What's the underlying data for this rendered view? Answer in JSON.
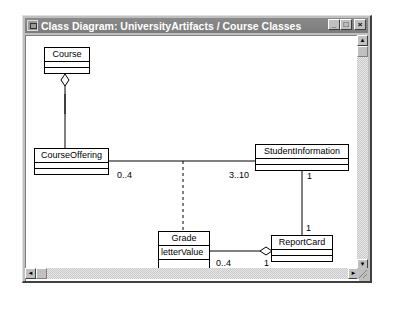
{
  "window": {
    "title": "Class Diagram: UniversityArtifacts / Course Classes",
    "buttons": {
      "minimize": "_",
      "maximize": "□",
      "close": "×"
    }
  },
  "scrollbars": {
    "vertical": {
      "up": "▲",
      "down": "▼"
    },
    "horizontal": {
      "left": "◄",
      "right": "►"
    }
  },
  "diagram": {
    "classes": [
      {
        "id": "course",
        "name": "Course",
        "attributes": []
      },
      {
        "id": "course-offering",
        "name": "CourseOffering",
        "attributes": []
      },
      {
        "id": "student-information",
        "name": "StudentInformation",
        "attributes": []
      },
      {
        "id": "grade",
        "name": "Grade",
        "attributes": [
          "letterValue"
        ]
      },
      {
        "id": "report-card",
        "name": "ReportCard",
        "attributes": []
      }
    ],
    "associations": [
      {
        "from": "Course",
        "to": "CourseOffering",
        "type": "aggregation"
      },
      {
        "from": "CourseOffering",
        "to": "StudentInformation",
        "type": "association",
        "from_mult": "0..4",
        "to_mult": "3..10"
      },
      {
        "from": "Grade",
        "to": "association CourseOffering-StudentInformation",
        "type": "association-class (dashed)"
      },
      {
        "from": "StudentInformation",
        "to": "ReportCard",
        "type": "association",
        "from_mult": "1",
        "to_mult": "1"
      },
      {
        "from": "Grade",
        "to": "ReportCard",
        "type": "aggregation",
        "from_mult": "0..4",
        "to_mult": "1"
      }
    ],
    "multiplicities": {
      "offering_to_student_near_offering": "0..4",
      "offering_to_student_near_student": "3..10",
      "student_to_report_near_student": "1",
      "student_to_report_near_report": "1",
      "grade_to_report_near_grade": "0..4",
      "grade_to_report_near_report": "1"
    }
  }
}
